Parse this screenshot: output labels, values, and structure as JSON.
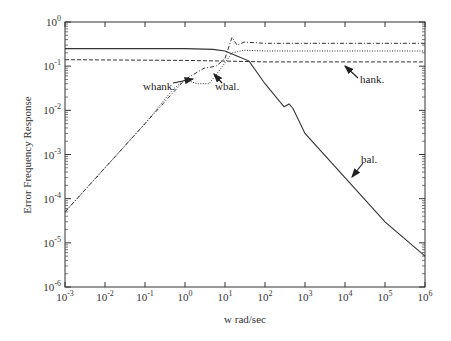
{
  "chart_data": {
    "type": "line",
    "title": "",
    "xlabel": "w rad/sec",
    "ylabel": "Error Frequency Response",
    "xscale": "log",
    "yscale": "log",
    "xlim": [
      0.001,
      1000000
    ],
    "ylim": [
      1e-06,
      1
    ],
    "grid": false,
    "legend": "annotations",
    "x_tick_labels": [
      "10-3",
      "10-2",
      "10-1",
      "100",
      "101",
      "102",
      "103",
      "104",
      "105",
      "106"
    ],
    "y_tick_labels": [
      "10-6",
      "10-5",
      "10-4",
      "10-3",
      "10-2",
      "10-1",
      "100"
    ],
    "series": [
      {
        "name": "bal.",
        "style": "solid",
        "x": [
          0.001,
          0.1,
          1,
          5,
          10,
          20,
          40,
          100,
          300,
          400,
          500,
          1000,
          10000,
          100000,
          1000000
        ],
        "y": [
          0.25,
          0.25,
          0.25,
          0.24,
          0.22,
          0.17,
          0.13,
          0.04,
          0.012,
          0.014,
          0.011,
          0.003,
          0.0003,
          3e-05,
          5e-06
        ]
      },
      {
        "name": "hank.",
        "style": "dashed",
        "x": [
          0.001,
          1,
          10,
          100,
          1000,
          10000,
          100000,
          1000000
        ],
        "y": [
          0.14,
          0.135,
          0.13,
          0.125,
          0.125,
          0.125,
          0.125,
          0.125
        ]
      },
      {
        "name": "whank.",
        "style": "dash-dot",
        "x": [
          0.001,
          0.01,
          0.1,
          1,
          3,
          6,
          10,
          15,
          20,
          30,
          100,
          1000,
          1000000
        ],
        "y": [
          5e-05,
          0.0005,
          0.005,
          0.05,
          0.09,
          0.1,
          0.15,
          0.45,
          0.3,
          0.35,
          0.33,
          0.33,
          0.33
        ]
      },
      {
        "name": "wbal.",
        "style": "dotted",
        "x": [
          0.001,
          0.01,
          0.1,
          0.5,
          1,
          2,
          4,
          8,
          15,
          30,
          100,
          1000,
          1000000
        ],
        "y": [
          5e-05,
          0.0005,
          0.005,
          0.03,
          0.05,
          0.04,
          0.04,
          0.09,
          0.2,
          0.23,
          0.22,
          0.22,
          0.22
        ]
      }
    ],
    "annotations": [
      {
        "text": "whank.",
        "arrow_to_series": "whank."
      },
      {
        "text": "wbal.",
        "arrow_to_series": "wbal."
      },
      {
        "text": "hank.",
        "arrow_to_series": "hank."
      },
      {
        "text": "bal.",
        "arrow_to_series": "bal."
      }
    ]
  },
  "labels": {
    "xlabel": "w rad/sec",
    "ylabel": "Error Frequency Response",
    "annot_whank": "whank.",
    "annot_wbal": "wbal.",
    "annot_hank": "hank.",
    "annot_bal": "bal."
  }
}
